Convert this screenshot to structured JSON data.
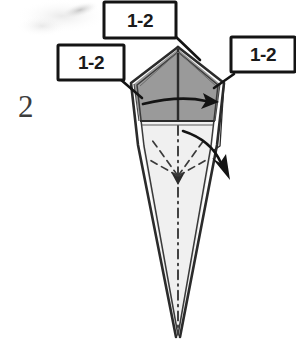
{
  "figure": {
    "type": "origami-fold-diagram",
    "step_number": "2",
    "background_color": "#ffffff",
    "ink_color": "#1a1a1a",
    "upper_panel_color": "#9a9a9a",
    "lower_panel_color": "#f0f0f0",
    "edge_color": "#2b2b2b"
  },
  "callouts": [
    {
      "label": "1-2",
      "position": "top",
      "points_to": "apex-vertex"
    },
    {
      "label": "1-2",
      "position": "left",
      "points_to": "left-shoulder-vertex"
    },
    {
      "label": "1-2",
      "position": "right",
      "points_to": "right-shoulder-vertex"
    }
  ],
  "arrows": [
    {
      "name": "horizontal-fold-arrow",
      "direction": "right",
      "style": "curved-solid"
    },
    {
      "name": "valley-fold-arrow",
      "direction": "down-right",
      "style": "curved-solid"
    },
    {
      "name": "center-collapse-arrow",
      "direction": "down",
      "style": "straight-dashed"
    }
  ],
  "fold_lines": [
    {
      "name": "center-axis",
      "style": "dash-dot",
      "orientation": "vertical"
    },
    {
      "name": "radiating-crease-upper-left",
      "style": "dashed"
    },
    {
      "name": "radiating-crease-upper-right",
      "style": "dashed"
    },
    {
      "name": "radiating-crease-lower-left",
      "style": "dashed"
    },
    {
      "name": "radiating-crease-lower-right",
      "style": "dashed"
    }
  ]
}
